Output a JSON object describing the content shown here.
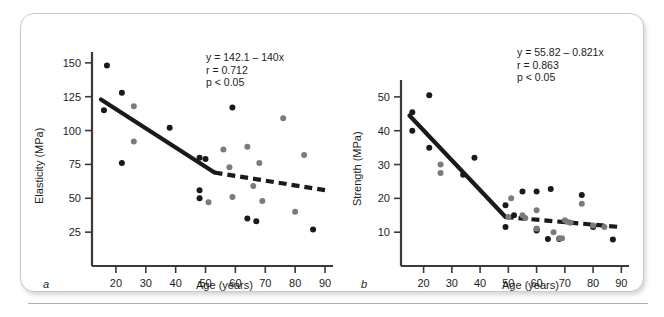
{
  "figure": {
    "panel_a_letter": "a",
    "panel_b_letter": "b"
  },
  "chart_data": [
    {
      "type": "scatter",
      "panel": "a",
      "title": "",
      "xlabel": "Age (years)",
      "ylabel": "Elasticity (MPa)",
      "xlim": [
        12,
        92
      ],
      "ylim": [
        0,
        158
      ],
      "xticks": [
        20,
        30,
        40,
        50,
        60,
        70,
        80,
        90
      ],
      "xticklabels": [
        "20",
        "30",
        "40",
        "50",
        "60",
        "70",
        "80",
        "90"
      ],
      "yticks": [
        25,
        50,
        75,
        100,
        125,
        150
      ],
      "yticklabels": [
        "25",
        "50",
        "75",
        "100",
        "125",
        "150"
      ],
      "grid": false,
      "legend": "none",
      "annotation": {
        "equation": "y = 142.1 – 140x",
        "r": "r = 0.712",
        "p": "p < 0.05"
      },
      "series": [
        {
          "name": "black-points",
          "color": "#1a1a1a",
          "points": [
            [
              17,
              148
            ],
            [
              22,
              128
            ],
            [
              16,
              115
            ],
            [
              22,
              76
            ],
            [
              38,
              102
            ],
            [
              48,
              80
            ],
            [
              50,
              79
            ],
            [
              48,
              56
            ],
            [
              48,
              50
            ],
            [
              59,
              117
            ],
            [
              64,
              35
            ],
            [
              67,
              33
            ],
            [
              86,
              27
            ]
          ]
        },
        {
          "name": "gray-points",
          "color": "#7b7b7b",
          "points": [
            [
              26,
              118
            ],
            [
              26,
              92
            ],
            [
              51,
              47
            ],
            [
              56,
              86
            ],
            [
              58,
              73
            ],
            [
              59,
              51
            ],
            [
              64,
              88
            ],
            [
              66,
              59
            ],
            [
              68,
              76
            ],
            [
              69,
              48
            ],
            [
              76,
              109
            ],
            [
              80,
              40
            ],
            [
              83,
              82
            ]
          ]
        }
      ],
      "fit_solid": {
        "x1": 15,
        "y1": 123,
        "x2": 53,
        "y2": 69
      },
      "fit_dashed": {
        "x1": 53,
        "y1": 69,
        "x2": 90,
        "y2": 56
      }
    },
    {
      "type": "scatter",
      "panel": "b",
      "title": "",
      "xlabel": "Age (years)",
      "ylabel": "Strength (MPa)",
      "xlim": [
        12,
        92
      ],
      "ylim": [
        0,
        55
      ],
      "xticks": [
        20,
        30,
        40,
        50,
        60,
        70,
        80,
        90
      ],
      "xticklabels": [
        "20",
        "30",
        "40",
        "50",
        "60",
        "70",
        "80",
        "90"
      ],
      "yticks": [
        10,
        20,
        30,
        40,
        50
      ],
      "yticklabels": [
        "10",
        "20",
        "30",
        "40",
        "50"
      ],
      "grid": false,
      "legend": "none",
      "annotation": {
        "equation": "y = 55.82 – 0.821x",
        "r": "r = 0.863",
        "p": "p < 0.05"
      },
      "series": [
        {
          "name": "black-points",
          "color": "#1a1a1a",
          "points": [
            [
              16,
              45.5
            ],
            [
              22,
              50.5
            ],
            [
              16,
              40
            ],
            [
              22,
              35
            ],
            [
              34,
              27
            ],
            [
              38,
              32
            ],
            [
              49,
              18
            ],
            [
              49,
              11.5
            ],
            [
              52,
              15
            ],
            [
              55,
              22
            ],
            [
              60,
              22
            ],
            [
              60,
              11
            ],
            [
              60,
              10.5
            ],
            [
              64,
              8
            ],
            [
              65,
              22.8
            ],
            [
              68,
              8
            ],
            [
              76,
              21
            ],
            [
              80,
              11.5
            ],
            [
              87,
              7.8
            ]
          ]
        },
        {
          "name": "gray-points",
          "color": "#7b7b7b",
          "points": [
            [
              26,
              30
            ],
            [
              26,
              27.5
            ],
            [
              50,
              14.5
            ],
            [
              51,
              20
            ],
            [
              55,
              15
            ],
            [
              56,
              14.2
            ],
            [
              60,
              16.5
            ],
            [
              60,
              11
            ],
            [
              66,
              10
            ],
            [
              68,
              8.2
            ],
            [
              69,
              8.2
            ],
            [
              70,
              13.5
            ],
            [
              71,
              13
            ],
            [
              72,
              12.8
            ],
            [
              76,
              18.4
            ],
            [
              80,
              12
            ],
            [
              84,
              11.5
            ]
          ]
        }
      ],
      "fit_solid": {
        "x1": 15,
        "y1": 44.5,
        "x2": 49,
        "y2": 14.5
      },
      "fit_dashed": {
        "x1": 49,
        "y1": 14.5,
        "x2": 90,
        "y2": 11.5
      }
    }
  ]
}
